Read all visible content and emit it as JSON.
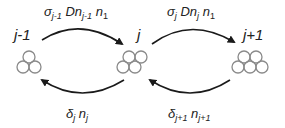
{
  "diagram": {
    "type": "cluster-size transition diagram",
    "nodes": [
      {
        "id": "j-1",
        "label": "j-1",
        "circles": 3
      },
      {
        "id": "j",
        "label": "j",
        "circles": 4
      },
      {
        "id": "j+1",
        "label": "j+1",
        "circles": 5
      }
    ],
    "edges": [
      {
        "from": "j-1",
        "to": "j",
        "direction": "forward",
        "label": {
          "sym1": "σ",
          "sub1": "j-1",
          "sym2": " Dn",
          "sub2": "j-1",
          "sym3": " n",
          "sub3": "1"
        }
      },
      {
        "from": "j",
        "to": "j+1",
        "direction": "forward",
        "label": {
          "sym1": "σ",
          "sub1": "j",
          "sym2": " Dn",
          "sub2": "j",
          "sym3": " n",
          "sub3": "1"
        }
      },
      {
        "from": "j",
        "to": "j-1",
        "direction": "backward",
        "label": {
          "sym1": "δ",
          "sub1": "j",
          "sym2": " n",
          "sub2": "j"
        }
      },
      {
        "from": "j+1",
        "to": "j",
        "direction": "backward",
        "label": {
          "sym1": "δ",
          "sub1": "j+1",
          "sym2": " n",
          "sub2": "j+1"
        }
      }
    ],
    "colors": {
      "circle_stroke": "#8a8a8a",
      "arrow": "#1a1a1a",
      "text": "#222222"
    }
  }
}
